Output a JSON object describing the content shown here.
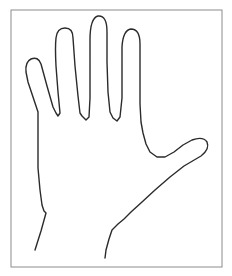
{
  "document": {
    "title": "Hand Outline Drawing",
    "subject": "left-hand-palm-outline",
    "background_color": "#ffffff"
  },
  "frame": {
    "name": "border-frame",
    "x": 11,
    "y": 10,
    "width": 211,
    "height": 257,
    "stroke_color": "#8c8c8c",
    "stroke_width": 1,
    "fill_color": "#ffffff"
  },
  "drawing": {
    "name": "hand-outline",
    "stroke_color": "#2b2b2b",
    "stroke_width": 1.4,
    "fill": "none",
    "line_count": 1,
    "digits": [
      {
        "name": "pinky-finger",
        "tip_x": 34,
        "tip_y": 61
      },
      {
        "name": "ring-finger",
        "tip_x": 65,
        "tip_y": 28
      },
      {
        "name": "middle-finger",
        "tip_x": 98,
        "tip_y": 15
      },
      {
        "name": "index-finger",
        "tip_x": 131,
        "tip_y": 27
      },
      {
        "name": "thumb",
        "tip_x": 207,
        "tip_y": 146
      }
    ],
    "outline_path": "M 35 250 L 41 231 L 46 213 L 44 211 L 42 205 L 40 190 L 38 168 L 38 148 L 38 129 L 38 112 L 28 82 L 26 72 Q 25 62 31 59 Q 38 56 41 64 L 47 86 L 53 107 L 56 113 L 58 116 L 60 113 L 58 92 L 56 66 Q 55 47 56 38 Q 57 28 65 28 Q 73 28 73 38 L 75 66 L 78 96 L 80 113 L 82 116 L 86 120 L 89 117 L 90 98 L 90 70 L 90 40 Q 90 18 98 16 Q 107 15 107 32 L 107 62 L 108 92 L 110 112 L 113 118 L 117 121 L 120 117 L 122 98 L 122 72 L 122 47 Q 123 30 131 29 Q 140 29 140 44 L 140 74 L 140 104 L 141 122 L 143 133 L 146 144 L 150 152 L 157 157 L 165 157 L 174 152 L 183 145 L 192 140 Q 203 136 207 142 Q 210 149 201 156 L 184 166 L 170 177 L 155 190 L 142 202 L 131 212 L 124 219 L 118 224 L 112 230 L 109 239 L 106 250 L 105 258"
  }
}
